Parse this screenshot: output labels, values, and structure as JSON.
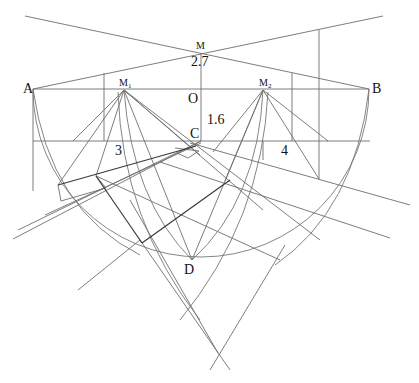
{
  "diagram": {
    "type": "perspective-construction",
    "labels": {
      "A": "A",
      "B": "B",
      "M": "M",
      "M1_base": "M",
      "M1_sub": "1",
      "M2_base": "M",
      "M2_sub": "2",
      "O": "O",
      "C": "C",
      "D": "D",
      "dist_MO": "2.7",
      "dist_OC": "1.6",
      "side_3": "3",
      "side_4": "4"
    },
    "points": {
      "A": [
        33,
        89
      ],
      "B": [
        369,
        89
      ],
      "M": [
        201,
        53
      ],
      "M1": [
        124,
        90
      ],
      "M2": [
        263,
        90
      ],
      "O": [
        201,
        89
      ],
      "C": [
        201,
        141
      ],
      "D": [
        192,
        260
      ]
    },
    "colors": {
      "line": "#6e6e6e",
      "heavy_line": "#3a3a3a",
      "text": "#111111",
      "background": "#ffffff"
    }
  }
}
